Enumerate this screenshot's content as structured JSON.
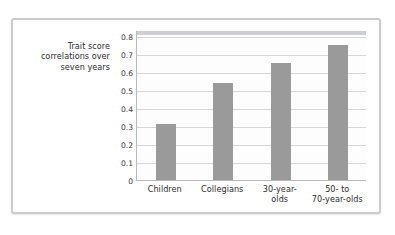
{
  "chart_data": {
    "type": "bar",
    "title": "",
    "xlabel": "",
    "ylabel": "Trait score correlations over seven years",
    "ylabel_lines": [
      "Trait score",
      "correlations over",
      "seven years"
    ],
    "categories": [
      "Children",
      "Collegians",
      "30-year-olds",
      "50- to 70-year-olds"
    ],
    "category_label_lines": [
      [
        "Children"
      ],
      [
        "Collegians"
      ],
      [
        "30-year-",
        "olds"
      ],
      [
        "50-  to",
        "70-year-olds"
      ]
    ],
    "values": [
      0.31,
      0.54,
      0.65,
      0.75
    ],
    "ylim": [
      0,
      0.8
    ],
    "ytick_values": [
      0,
      0.1,
      0.2,
      0.3,
      0.4,
      0.5,
      0.6,
      0.7,
      0.8
    ],
    "ytick_labels": [
      "0",
      "0.1",
      "0.2",
      "0.3",
      "0.4",
      "0.5",
      "0.6",
      "0.7",
      "0.8"
    ],
    "grid": true,
    "legend": "none",
    "bar_color": "#9a9a9a",
    "gridline_color": "#d6d7d9",
    "plot_background": "#fdfdfd",
    "axis_color": "#b9babc",
    "text_color": "#2b2b2b",
    "frame_color": "#c9cbcd"
  }
}
